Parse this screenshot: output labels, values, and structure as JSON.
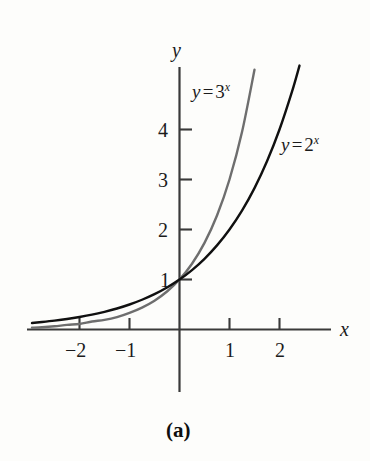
{
  "figure": {
    "caption": "(a)",
    "background_color": "#fdfdfb"
  },
  "axes": {
    "x_label": "x",
    "y_label": "y",
    "axis_color": "#3a3a3a",
    "x_ticks": [
      {
        "value": -2,
        "label": "−2"
      },
      {
        "value": -1,
        "label": "−1"
      },
      {
        "value": 1,
        "label": "1"
      },
      {
        "value": 2,
        "label": "2"
      }
    ],
    "y_ticks": [
      {
        "value": 1,
        "label": "1"
      },
      {
        "value": 2,
        "label": "2"
      },
      {
        "value": 3,
        "label": "3"
      },
      {
        "value": 4,
        "label": "4"
      }
    ]
  },
  "curve_labels": {
    "three": {
      "lhs": "y",
      "op": "=",
      "base": "3",
      "exp": "x"
    },
    "two": {
      "lhs": "y",
      "op": "=",
      "base": "2",
      "exp": "x"
    }
  },
  "chart_data": {
    "type": "line",
    "title": "(a)",
    "xlabel": "x",
    "ylabel": "y",
    "grid": false,
    "legend": "inline-annotations",
    "xlim": [
      -3.0,
      3.0
    ],
    "ylim": [
      -0.2,
      5.4
    ],
    "xticks": [
      -2,
      -1,
      1,
      2
    ],
    "yticks": [
      1,
      2,
      3,
      4
    ],
    "series": [
      {
        "name": "y = 3^x",
        "color": "#6e6e6e",
        "linewidth": 2.4,
        "equation": "y = 3^x",
        "x": [
          -2.95,
          -2.75,
          -2.5,
          -2.25,
          -2.0,
          -1.75,
          -1.5,
          -1.25,
          -1.0,
          -0.75,
          -0.5,
          -0.25,
          0.0,
          0.25,
          0.5,
          0.75,
          1.0,
          1.25,
          1.5
        ],
        "y": [
          0.037,
          0.045,
          0.064,
          0.092,
          0.111,
          0.159,
          0.192,
          0.248,
          0.333,
          0.439,
          0.577,
          0.76,
          1.0,
          1.316,
          1.732,
          2.279,
          3.0,
          3.948,
          5.196
        ]
      },
      {
        "name": "y = 2^x",
        "color": "#101010",
        "linewidth": 2.4,
        "equation": "y = 2^x",
        "x": [
          -2.95,
          -2.75,
          -2.5,
          -2.25,
          -2.0,
          -1.75,
          -1.5,
          -1.25,
          -1.0,
          -0.75,
          -0.5,
          -0.25,
          0.0,
          0.25,
          0.5,
          0.75,
          1.0,
          1.25,
          1.5,
          1.75,
          2.0,
          2.25,
          2.4
        ],
        "y": [
          0.129,
          0.149,
          0.177,
          0.21,
          0.25,
          0.297,
          0.354,
          0.42,
          0.5,
          0.595,
          0.707,
          0.841,
          1.0,
          1.189,
          1.414,
          1.682,
          2.0,
          2.378,
          2.828,
          3.364,
          4.0,
          4.757,
          5.278
        ]
      }
    ],
    "annotations": [
      {
        "text": "y = 3^x",
        "x": -0.35,
        "y": 4.55
      },
      {
        "text": "y = 2^x",
        "x": 1.5,
        "y": 3.6
      }
    ],
    "intersection": {
      "x": 0,
      "y": 1
    }
  }
}
